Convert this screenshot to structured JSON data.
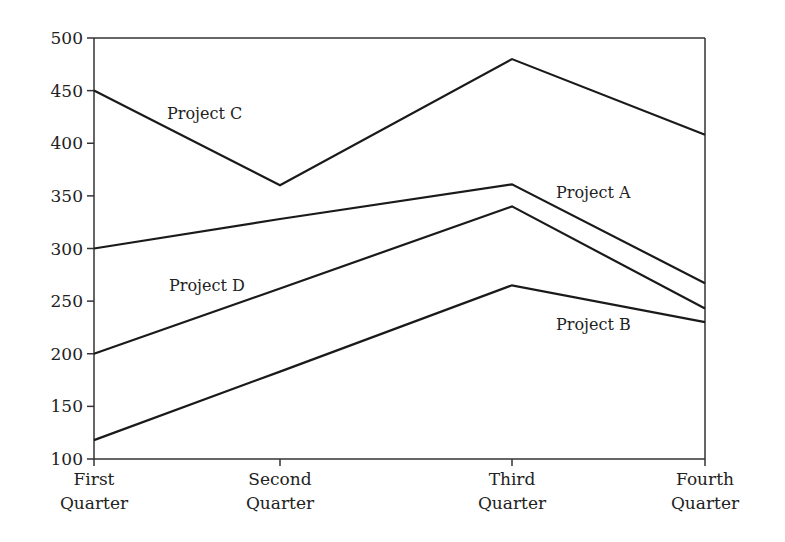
{
  "chart_data": {
    "type": "line",
    "title": "",
    "xlabel": "",
    "ylabel": "",
    "categories": [
      [
        "First",
        "Quarter"
      ],
      [
        "Second",
        "Quarter"
      ],
      [
        "Third",
        "Quarter"
      ],
      [
        "Fourth",
        "Quarter"
      ]
    ],
    "ylim": [
      100,
      500
    ],
    "yticks": [
      100,
      150,
      200,
      250,
      300,
      350,
      400,
      450,
      500
    ],
    "grid": false,
    "legend": "inline labels",
    "series": [
      {
        "name": "Project A",
        "values": [
          300,
          328,
          361,
          267
        ],
        "label": "Project A"
      },
      {
        "name": "Project B",
        "values": [
          118,
          183,
          265,
          230
        ],
        "label": "Project B"
      },
      {
        "name": "Project C",
        "values": [
          450,
          360,
          480,
          408
        ],
        "label": "Project C"
      },
      {
        "name": "Project D",
        "values": [
          200,
          262,
          340,
          243
        ],
        "label": "Project D"
      }
    ],
    "line_color": "#1a1a1a"
  }
}
